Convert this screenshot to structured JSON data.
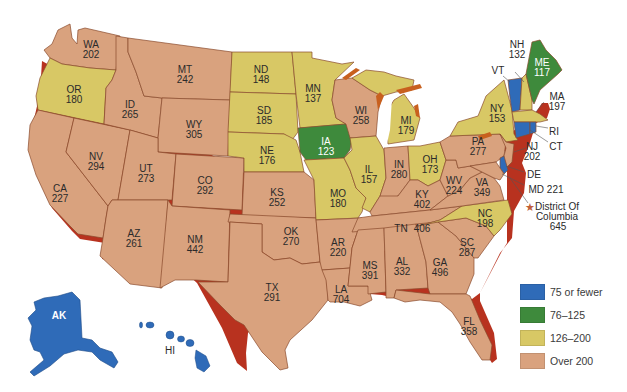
{
  "legend": {
    "items": [
      {
        "label": "75 or fewer",
        "color": "#2f6bb8"
      },
      {
        "label": "76–125",
        "color": "#3e8a3c"
      },
      {
        "label": "126–200",
        "color": "#d8c865"
      },
      {
        "label": "Over 200",
        "color": "#d9a27e"
      }
    ]
  },
  "colors": {
    "blue": "#2f6bb8",
    "green": "#3e8a3c",
    "yellow": "#d8c865",
    "tan": "#d9a27e",
    "coast": "#b8321f",
    "border": "#8a4a2c"
  },
  "states": {
    "WA": {
      "abbr": "WA",
      "value": "202"
    },
    "OR": {
      "abbr": "OR",
      "value": "180"
    },
    "CA": {
      "abbr": "CA",
      "value": "227"
    },
    "ID": {
      "abbr": "ID",
      "value": "265"
    },
    "NV": {
      "abbr": "NV",
      "value": "294"
    },
    "MT": {
      "abbr": "MT",
      "value": "242"
    },
    "WY": {
      "abbr": "WY",
      "value": "305"
    },
    "UT": {
      "abbr": "UT",
      "value": "273"
    },
    "AZ": {
      "abbr": "AZ",
      "value": "261"
    },
    "CO": {
      "abbr": "CO",
      "value": "292"
    },
    "NM": {
      "abbr": "NM",
      "value": "442"
    },
    "ND": {
      "abbr": "ND",
      "value": "148"
    },
    "SD": {
      "abbr": "SD",
      "value": "185"
    },
    "NE": {
      "abbr": "NE",
      "value": "176"
    },
    "KS": {
      "abbr": "KS",
      "value": "252"
    },
    "OK": {
      "abbr": "OK",
      "value": "270"
    },
    "TX": {
      "abbr": "TX",
      "value": "291"
    },
    "MN": {
      "abbr": "MN",
      "value": "137"
    },
    "IA": {
      "abbr": "IA",
      "value": "123"
    },
    "MO": {
      "abbr": "MO",
      "value": "180"
    },
    "AR": {
      "abbr": "AR",
      "value": "220"
    },
    "LA": {
      "abbr": "LA",
      "value": "704"
    },
    "WI": {
      "abbr": "WI",
      "value": "258"
    },
    "IL": {
      "abbr": "IL",
      "value": "157"
    },
    "MI": {
      "abbr": "MI",
      "value": "179"
    },
    "IN": {
      "abbr": "IN",
      "value": "280"
    },
    "OH": {
      "abbr": "OH",
      "value": "173"
    },
    "KY": {
      "abbr": "KY",
      "value": "402"
    },
    "TN": {
      "abbr": "TN",
      "value": "406"
    },
    "MS": {
      "abbr": "MS",
      "value": "391"
    },
    "AL": {
      "abbr": "AL",
      "value": "332"
    },
    "GA": {
      "abbr": "GA",
      "value": "496"
    },
    "FL": {
      "abbr": "FL",
      "value": "358"
    },
    "SC": {
      "abbr": "SC",
      "value": "287"
    },
    "NC": {
      "abbr": "NC",
      "value": "198"
    },
    "VA": {
      "abbr": "VA",
      "value": "349"
    },
    "WV": {
      "abbr": "WV",
      "value": "224"
    },
    "PA": {
      "abbr": "PA",
      "value": "277"
    },
    "NY": {
      "abbr": "NY",
      "value": "153"
    },
    "VT": {
      "abbr": "VT",
      "value": ""
    },
    "NH": {
      "abbr": "NH",
      "value": "132"
    },
    "ME": {
      "abbr": "ME",
      "value": "117"
    },
    "MA": {
      "abbr": "MA",
      "value": "197"
    },
    "RI": {
      "abbr": "RI",
      "value": ""
    },
    "CT": {
      "abbr": "CT",
      "value": ""
    },
    "NJ": {
      "abbr": "NJ",
      "value": "202"
    },
    "DE": {
      "abbr": "DE",
      "value": ""
    },
    "MD": {
      "abbr": "MD",
      "value": "221",
      "text": "MD 221"
    },
    "DC": {
      "line1": "District Of",
      "line2": "Columbia",
      "value": "645"
    },
    "AK": {
      "abbr": "AK",
      "value": ""
    },
    "HI": {
      "abbr": "HI",
      "value": ""
    }
  }
}
